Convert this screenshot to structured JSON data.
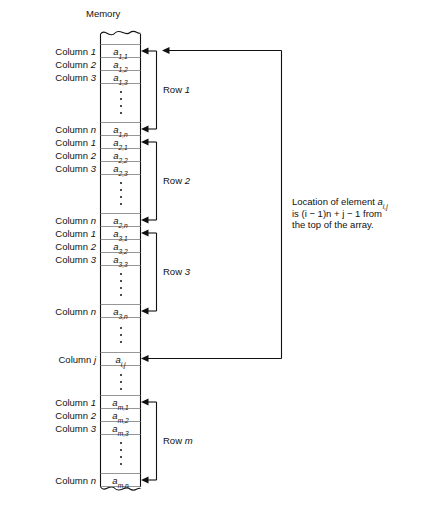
{
  "title": "Memory",
  "note": {
    "line1_pre": "Location of element ",
    "line1_var": "a",
    "line1_sub": "i,j",
    "line2": "is (i − 1)n + j − 1 from",
    "line3": "the top of the array."
  },
  "rows": [
    {
      "id": "row-1",
      "label": "Row 1",
      "label_plain": "Row",
      "label_index": "1",
      "cells": [
        {
          "col": "Column 1",
          "col_plain": "Column",
          "col_index": "1",
          "base": "a",
          "sub": "1,1"
        },
        {
          "col": "Column 2",
          "col_plain": "Column",
          "col_index": "2",
          "base": "a",
          "sub": "1,2"
        },
        {
          "col": "Column 3",
          "col_plain": "Column",
          "col_index": "3",
          "base": "a",
          "sub": "1,3"
        },
        {
          "col": "Column n",
          "col_plain": "Column",
          "col_index": "n",
          "base": "a",
          "sub": "1,n"
        }
      ]
    },
    {
      "id": "row-2",
      "label": "Row 2",
      "label_plain": "Row",
      "label_index": "2",
      "cells": [
        {
          "col": "Column 1",
          "col_plain": "Column",
          "col_index": "1",
          "base": "a",
          "sub": "2,1"
        },
        {
          "col": "Column 2",
          "col_plain": "Column",
          "col_index": "2",
          "base": "a",
          "sub": "2,2"
        },
        {
          "col": "Column 3",
          "col_plain": "Column",
          "col_index": "3",
          "base": "a",
          "sub": "2,3"
        },
        {
          "col": "Column n",
          "col_plain": "Column",
          "col_index": "n",
          "base": "a",
          "sub": "2,n"
        }
      ]
    },
    {
      "id": "row-3",
      "label": "Row 3",
      "label_plain": "Row",
      "label_index": "3",
      "cells": [
        {
          "col": "Column 1",
          "col_plain": "Column",
          "col_index": "1",
          "base": "a",
          "sub": "3,1"
        },
        {
          "col": "Column 2",
          "col_plain": "Column",
          "col_index": "2",
          "base": "a",
          "sub": "3,2"
        },
        {
          "col": "Column 3",
          "col_plain": "Column",
          "col_index": "3",
          "base": "a",
          "sub": "3,3"
        },
        {
          "col": "Column n",
          "col_plain": "Column",
          "col_index": "n",
          "base": "a",
          "sub": "3,n"
        }
      ]
    },
    {
      "id": "row-ij",
      "label": "",
      "label_plain": "",
      "label_index": "",
      "cells": [
        {
          "col": "Column j",
          "col_plain": "Column",
          "col_index": "j",
          "base": "a",
          "sub": "i,j"
        }
      ]
    },
    {
      "id": "row-m",
      "label": "Row m",
      "label_plain": "Row",
      "label_index": "m",
      "cells": [
        {
          "col": "Column 1",
          "col_plain": "Column",
          "col_index": "1",
          "base": "a",
          "sub": "m,1"
        },
        {
          "col": "Column 2",
          "col_plain": "Column",
          "col_index": "2",
          "base": "a",
          "sub": "m,2"
        },
        {
          "col": "Column 3",
          "col_plain": "Column",
          "col_index": "3",
          "base": "a",
          "sub": "m,3"
        },
        {
          "col": "Column n",
          "col_plain": "Column",
          "col_index": "n",
          "base": "a",
          "sub": "m,n"
        }
      ]
    }
  ],
  "colors": {
    "stroke": "#111111",
    "cell_border": "#8a8a8a",
    "background": "#ffffff"
  }
}
